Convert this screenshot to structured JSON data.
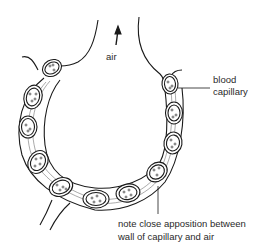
{
  "diagram": {
    "labels": {
      "air": "air",
      "capillary_line1": "blood",
      "capillary_line2": "capillary",
      "note_line1": "note close apposition between",
      "note_line2": "wall of capillary and air"
    },
    "colors": {
      "line": "#1a1a1a",
      "background": "#ffffff",
      "text": "#2a2a2a"
    },
    "capillary_count": 11
  }
}
